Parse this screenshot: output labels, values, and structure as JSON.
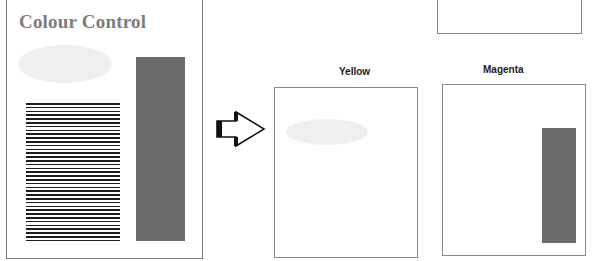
{
  "source_page": {
    "title": "Colour Control",
    "elements": [
      "ellipse-light-grey",
      "horizontal-line-block",
      "dark-grey-bar"
    ]
  },
  "arrow": {
    "icon": "right-arrow-icon",
    "direction": "right"
  },
  "separations": [
    {
      "label": "Yellow",
      "contents": [
        "ellipse-light-grey"
      ]
    },
    {
      "label": "Magenta",
      "contents": [
        "dark-grey-bar"
      ]
    }
  ],
  "colors": {
    "page_border": "#8a8a8a",
    "title_text": "#7c7c7c",
    "ellipse_fill": "#efefef",
    "bar_fill": "#6a6a6a",
    "stripe": "#1e1e1e",
    "label_text": "#1a1a1a"
  }
}
